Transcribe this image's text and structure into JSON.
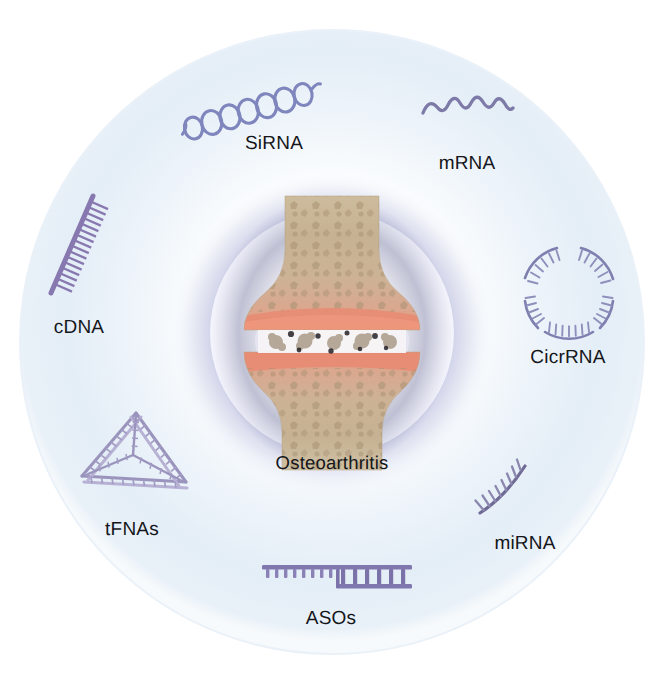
{
  "figure": {
    "center": {
      "label": "Osteoarthritis",
      "illustration": "synovial-joint-cross-section",
      "description": "Cross-section of a degenerated synovial joint with eroded cartilage and joint-space debris"
    },
    "colors": {
      "outer_ring_fill": "#e8f0f7",
      "outer_ring_edge": "#dbe7f2",
      "inner_glow": "#b9bcdf",
      "inner_core": "#ffffff",
      "molecule_purple": "#8c7fb4",
      "molecule_blue_violet": "#7f86bd",
      "molecule_light": "#a9a8cc",
      "bone_tan": "#c9b596",
      "bone_dark": "#a89173",
      "cartilage_pink": "#e4937c",
      "joint_space": "#f2eeee",
      "label_text": "#14161a",
      "page_background": "#ffffff"
    },
    "nodes": [
      {
        "id": "sirna",
        "label": "SiRNA",
        "icon": "sirna-double-helix-icon",
        "icon_description": "Chain of linked loops forming a double helix",
        "label_x": 274,
        "label_y": 143,
        "angle_deg": 248
      },
      {
        "id": "mrna",
        "label": "mRNA",
        "icon": "mrna-squiggle-icon",
        "icon_description": "Single-stranded diagonal zigzag wave",
        "label_x": 467,
        "label_y": 163,
        "angle_deg": 296
      },
      {
        "id": "cicrrna",
        "label": "CicrRNA",
        "icon": "circrna-broken-circle-icon",
        "icon_description": "Four toothed arc segments arranged in a circle",
        "label_x": 568,
        "label_y": 357,
        "angle_deg": 0
      },
      {
        "id": "mirna",
        "label": "miRNA",
        "icon": "mirna-curved-comb-icon",
        "icon_description": "Single curved strand with comb teeth",
        "label_x": 525,
        "label_y": 543,
        "angle_deg": 55
      },
      {
        "id": "asos",
        "label": "ASOs",
        "icon": "aso-partial-duplex-icon",
        "icon_description": "Single toothed strand hybridized to a ladder duplex region",
        "label_x": 331,
        "label_y": 618,
        "angle_deg": 90
      },
      {
        "id": "tfnas",
        "label": "tFNAs",
        "icon": "tfna-tetrahedron-icon",
        "icon_description": "DNA tetrahedron wireframe built from ladder struts",
        "label_x": 132,
        "label_y": 529,
        "angle_deg": 128
      },
      {
        "id": "cdna",
        "label": "cDNA",
        "icon": "cdna-comb-icon",
        "icon_description": "Straight diagonal strand with dense comb teeth",
        "label_x": 79,
        "label_y": 327,
        "angle_deg": 180
      }
    ]
  }
}
